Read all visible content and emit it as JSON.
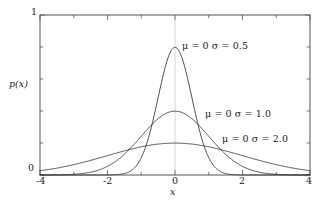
{
  "figure": {
    "background": "#ffffff",
    "frame_color": "#555555",
    "curve_color": "#3a3a3a",
    "gridline_color": "#cccccc",
    "text_color": "#1a1a1a"
  },
  "axes": {
    "x_title": "x",
    "y_title": "p(x)",
    "x_ticklabels": [
      "-4",
      "-2",
      "0",
      "2",
      "4"
    ],
    "y_ticklabels": [
      "0",
      "1"
    ]
  },
  "annotations": [
    {
      "text": "μ = 0  σ = 0.5"
    },
    {
      "text": "μ = 0  σ = 1.0"
    },
    {
      "text": "μ = 0  σ = 2.0"
    }
  ],
  "chart_data": {
    "type": "line",
    "title": "",
    "xlabel": "x",
    "ylabel": "p(x)",
    "xlim": [
      -4,
      4
    ],
    "ylim": [
      0,
      1
    ],
    "xticks": [
      -4,
      -2,
      0,
      2,
      4
    ],
    "yticks": [
      0,
      1
    ],
    "x_minor_tick_step": 1,
    "y_minor_tick_step": 0.2,
    "grid": "vertical line at x=0 only",
    "legend": "inline annotations next to each curve",
    "function": "gaussian pdf: p(x) = 1/(sigma*sqrt(2*pi)) * exp(-(x-mu)^2/(2*sigma^2))",
    "series": [
      {
        "name": "μ = 0  σ = 0.5",
        "mu": 0,
        "sigma": 0.5,
        "peak_value": 0.798,
        "x": [
          -4,
          -3.5,
          -3,
          -2.5,
          -2,
          -1.75,
          -1.5,
          -1.25,
          -1,
          -0.75,
          -0.5,
          -0.25,
          0,
          0.25,
          0.5,
          0.75,
          1,
          1.25,
          1.5,
          1.75,
          2,
          2.5,
          3,
          3.5,
          4
        ],
        "values": [
          0.0,
          0.0,
          0.0,
          0.0,
          0.0003,
          0.0022,
          0.0177,
          0.0889,
          0.108,
          0.2163,
          0.4839,
          0.7041,
          0.7979,
          0.7041,
          0.4839,
          0.2163,
          0.108,
          0.0889,
          0.0177,
          0.0022,
          0.0003,
          0.0,
          0.0,
          0.0,
          0.0
        ]
      },
      {
        "name": "μ = 0  σ = 1.0",
        "mu": 0,
        "sigma": 1.0,
        "peak_value": 0.399,
        "x": [
          -4,
          -3.5,
          -3,
          -2.5,
          -2,
          -1.5,
          -1,
          -0.5,
          0,
          0.5,
          1,
          1.5,
          2,
          2.5,
          3,
          3.5,
          4
        ],
        "values": [
          0.0001,
          0.0009,
          0.0044,
          0.0175,
          0.054,
          0.1295,
          0.242,
          0.3521,
          0.3989,
          0.3521,
          0.242,
          0.1295,
          0.054,
          0.0175,
          0.0044,
          0.0009,
          0.0001
        ]
      },
      {
        "name": "μ = 0  σ = 2.0",
        "mu": 0,
        "sigma": 2.0,
        "peak_value": 0.199,
        "x": [
          -4,
          -3.5,
          -3,
          -2.5,
          -2,
          -1.5,
          -1,
          -0.5,
          0,
          0.5,
          1,
          1.5,
          2,
          2.5,
          3,
          3.5,
          4
        ],
        "values": [
          0.027,
          0.0446,
          0.0648,
          0.0863,
          0.121,
          0.1506,
          0.176,
          0.1933,
          0.1995,
          0.1933,
          0.176,
          0.1506,
          0.121,
          0.0863,
          0.0648,
          0.0446,
          0.027
        ]
      }
    ]
  }
}
